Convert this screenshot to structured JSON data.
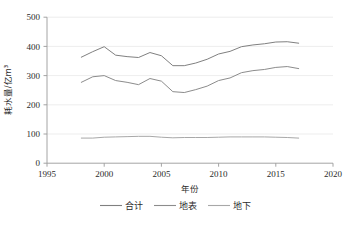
{
  "chart_data": {
    "type": "line",
    "title": "",
    "xlabel": "年份",
    "ylabel": "耗水量/亿m³",
    "xlim": [
      1995,
      2020
    ],
    "ylim": [
      0,
      500
    ],
    "xticks": [
      1995,
      2000,
      2005,
      2010,
      2015,
      2020
    ],
    "yticks": [
      0,
      100,
      200,
      300,
      400,
      500
    ],
    "grid": true,
    "legend_position": "bottom",
    "x": [
      1998,
      1999,
      2000,
      2001,
      2002,
      2003,
      2004,
      2005,
      2006,
      2007,
      2008,
      2009,
      2010,
      2011,
      2012,
      2013,
      2014,
      2015,
      2016,
      2017
    ],
    "series": [
      {
        "name": "合计",
        "color": "#808080",
        "values": [
          363,
          382,
          399,
          370,
          365,
          362,
          379,
          368,
          334,
          334,
          343,
          356,
          374,
          383,
          399,
          405,
          409,
          415,
          416,
          411
        ]
      },
      {
        "name": "地表",
        "color": "#8c8c8c",
        "values": [
          277,
          296,
          300,
          283,
          277,
          269,
          290,
          281,
          245,
          242,
          252,
          264,
          283,
          292,
          310,
          317,
          321,
          328,
          331,
          324
        ]
      },
      {
        "name": "地下",
        "color": "#a8a8a8",
        "values": [
          86,
          86,
          89,
          90,
          91,
          92,
          92,
          89,
          87,
          88,
          88,
          88,
          89,
          90,
          90,
          90,
          90,
          89,
          88,
          86
        ]
      }
    ]
  },
  "axis": {
    "y_label": "耗水量/亿m³",
    "x_label": "年份",
    "y_tick_labels": [
      "500",
      "400",
      "300",
      "200",
      "100",
      "0"
    ],
    "x_tick_labels": [
      "1995",
      "2000",
      "2005",
      "2010",
      "2015",
      "2020"
    ]
  },
  "legend": {
    "items": [
      {
        "label": "合计",
        "color": "#808080"
      },
      {
        "label": "地表",
        "color": "#8c8c8c"
      },
      {
        "label": "地下",
        "color": "#a8a8a8"
      }
    ]
  }
}
